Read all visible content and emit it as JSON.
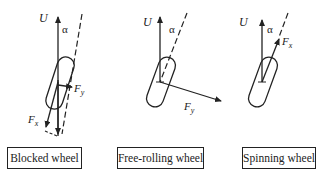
{
  "diagrams": [
    {
      "caption": "Blocked wheel",
      "labels": {
        "velocity": "U",
        "angle": "α",
        "force_x": "F",
        "force_x_sub": "x",
        "force_y": "F",
        "force_y_sub": "y"
      }
    },
    {
      "caption": "Free-rolling wheel",
      "labels": {
        "velocity": "U",
        "angle": "α",
        "force_y": "F",
        "force_y_sub": "y"
      }
    },
    {
      "caption": "Spinning wheel",
      "labels": {
        "velocity": "U",
        "angle": "α",
        "force_x": "F",
        "force_x_sub": "x"
      }
    }
  ],
  "colors": {
    "ink": "#222222",
    "background": "#ffffff"
  }
}
